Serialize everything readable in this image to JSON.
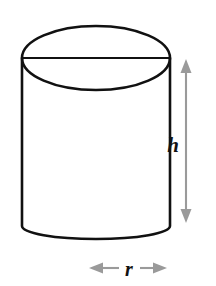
{
  "figure": {
    "shape_name": "cylinder",
    "background_color": "#ffffff",
    "outline_color": "#111111",
    "dimension_color": "#9a9a9a",
    "label_color": "#121212"
  },
  "labels": {
    "height": "h",
    "radius": "r"
  },
  "dimensions": {
    "height_arrow": {
      "name": "height-dimension-arrow",
      "orientation": "vertical",
      "x": 186,
      "y_top": 60,
      "y_bottom": 222,
      "double_headed": true
    },
    "radius_arrow": {
      "name": "radius-dimension-arrow",
      "orientation": "horizontal",
      "y": 268,
      "x_left": 90,
      "x_right": 166,
      "double_headed": true
    }
  },
  "geometry": {
    "top_ellipse": {
      "cx": 96,
      "cy": 58,
      "rx": 74,
      "ry": 32
    },
    "bottom_ellipse": {
      "cx": 96,
      "cy": 226,
      "rx": 74,
      "ry": 13
    },
    "left_wall_x": 22,
    "right_wall_x": 170,
    "body_top_y": 58,
    "body_bottom_y": 226
  }
}
